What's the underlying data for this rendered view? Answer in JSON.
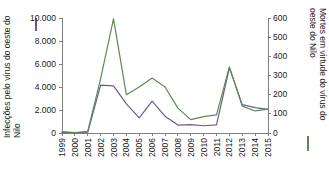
{
  "chart_data": {
    "type": "line",
    "title": "",
    "xlabel": "",
    "x": [
      1999,
      2000,
      2001,
      2002,
      2003,
      2004,
      2005,
      2006,
      2007,
      2008,
      2009,
      2010,
      2011,
      2012,
      2013,
      2014,
      2015
    ],
    "categories": [
      "1999",
      "2000",
      "2001",
      "2002",
      "2003",
      "2004",
      "2005",
      "2006",
      "2007",
      "2008",
      "2009",
      "2010",
      "2011",
      "2012",
      "2013",
      "2014",
      "2015"
    ],
    "series": [
      {
        "name": "Infecções pelo vírus do oeste do Nilo",
        "axis": "left",
        "color": "#6b5b95",
        "legend_marker": "purple-vertical-line",
        "values": [
          62,
          21,
          66,
          4156,
          4100,
          2539,
          1309,
          2774,
          1460,
          689,
          720,
          629,
          712,
          5674,
          2469,
          2205,
          2060
        ]
      },
      {
        "name": "Mortes em virtude do vírus do oeste do Nilo",
        "axis": "right",
        "color": "#5f8a4e",
        "legend_marker": "green-vertical-line",
        "values": [
          7,
          2,
          9,
          284,
          595,
          200,
          240,
          287,
          240,
          130,
          70,
          85,
          95,
          345,
          140,
          115,
          125
        ]
      }
    ],
    "left_axis": {
      "label": "Infecções pelo vírus do oeste do Nilo",
      "ticks": [
        "0",
        "2.000",
        "4.000",
        "6.000",
        "8.000",
        "10.000"
      ],
      "tick_values": [
        0,
        2000,
        4000,
        6000,
        8000,
        10000
      ],
      "ylim": [
        0,
        10000
      ]
    },
    "right_axis": {
      "label": "Mortes em virtude do vírus do oeste do Nilo",
      "ticks": [
        "0",
        "100",
        "200",
        "300",
        "400",
        "500",
        "600"
      ],
      "tick_values": [
        0,
        100,
        200,
        300,
        400,
        500,
        600
      ],
      "ylim": [
        0,
        600
      ]
    },
    "grid": false,
    "legend_position": "axis-titles"
  },
  "colors": {
    "infections_line": "#6b5b95",
    "deaths_line": "#5f8a4e",
    "axis": "#808080",
    "text": "#1a1a1a",
    "background": "#ffffff"
  }
}
